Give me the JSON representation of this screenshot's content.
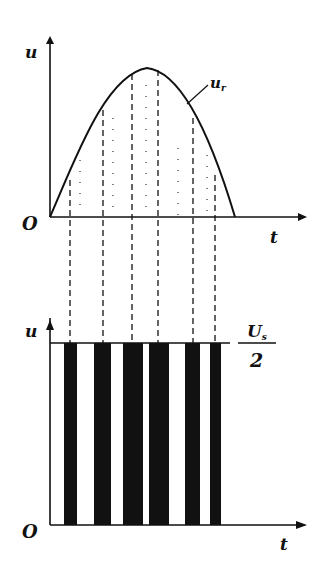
{
  "top_plot": {
    "y_axis_label": "u",
    "x_axis_label": "t",
    "origin_label": "O",
    "curve_label": "u_r",
    "curve_label_main": "u",
    "curve_label_sub": "r"
  },
  "bottom_plot": {
    "y_axis_label": "u",
    "x_axis_label": "t",
    "origin_label": "O",
    "level_label_num": "U",
    "level_label_num_sub": "s",
    "level_label_den": "2"
  },
  "pulse_edges_x": [
    [
      64,
      77
    ],
    [
      94,
      111
    ],
    [
      123,
      143
    ],
    [
      149,
      169
    ],
    [
      185,
      200
    ],
    [
      210,
      221
    ]
  ],
  "dashed_lines_x": [
    70,
    103,
    132,
    158,
    193,
    215
  ],
  "colors": {
    "ink": "#111111",
    "background": "#ffffff"
  }
}
